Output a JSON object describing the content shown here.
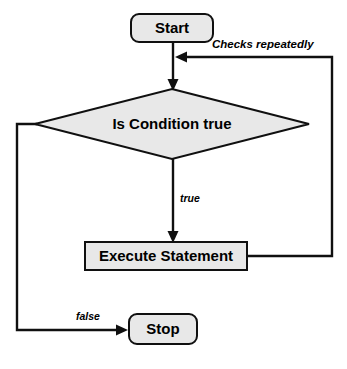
{
  "diagram": {
    "type": "flowchart",
    "canvas": {
      "width": 347,
      "height": 369
    },
    "colors": {
      "shape_fill": "#e8e8e8",
      "shape_stroke": "#101010",
      "connector": "#101010",
      "text": "#000000",
      "background": "#ffffff"
    },
    "nodes": [
      {
        "id": "start",
        "label": "Start",
        "shape": "rounded-rectangle",
        "x": 131,
        "y": 14,
        "width": 82,
        "height": 28
      },
      {
        "id": "condition",
        "label": "Is Condition true",
        "shape": "diamond",
        "cx": 172,
        "cy": 124,
        "half_width": 137,
        "half_height": 35
      },
      {
        "id": "execute",
        "label": "Execute Statement",
        "shape": "rectangle",
        "x": 85,
        "y": 242,
        "width": 162,
        "height": 28
      },
      {
        "id": "stop",
        "label": "Stop",
        "shape": "rounded-rectangle",
        "x": 129,
        "y": 314,
        "width": 68,
        "height": 30
      }
    ],
    "edges": [
      {
        "id": "start-to-condition",
        "from": "start",
        "to": "condition",
        "label": ""
      },
      {
        "id": "condition-true-to-execute",
        "from": "condition",
        "to": "execute",
        "label": "true",
        "label_x": 180,
        "label_y": 202
      },
      {
        "id": "execute-back-to-top",
        "from": "execute",
        "to": "start-to-condition",
        "label": "Checks repeatedly",
        "label_x": 212,
        "label_y": 48
      },
      {
        "id": "condition-false-to-stop",
        "from": "condition",
        "to": "stop",
        "label": "false",
        "label_x": 76,
        "label_y": 320
      }
    ]
  }
}
